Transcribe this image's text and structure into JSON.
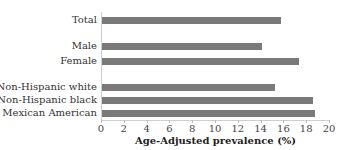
{
  "chart_data": {
    "type": "bar",
    "orientation": "horizontal",
    "title": "",
    "xlabel": "Age-Adjusted prevalence (%)",
    "ylabel": "",
    "xlim": [
      0,
      20
    ],
    "xticks": [
      0,
      2,
      4,
      6,
      8,
      10,
      12,
      14,
      16,
      18,
      20
    ],
    "grid": false,
    "legend": null,
    "categories": [
      "Total",
      "Male",
      "Female",
      "Non-Hispanic white",
      "Non-Hispanic black",
      "Mexican American"
    ],
    "values": [
      15.8,
      14.1,
      17.4,
      15.3,
      18.6,
      18.8
    ],
    "bar_color": "#7a7a7a"
  },
  "labels": {
    "total": "Total",
    "male": "Male",
    "female": "Female",
    "nhw": "Non-Hispanic white",
    "nhb": "Non-Hispanic black",
    "ma": "Mexican American"
  },
  "ticks": [
    "0",
    "2",
    "4",
    "6",
    "8",
    "10",
    "12",
    "14",
    "16",
    "18",
    "20"
  ],
  "xlabel": "Age-Adjusted prevalence (%)"
}
